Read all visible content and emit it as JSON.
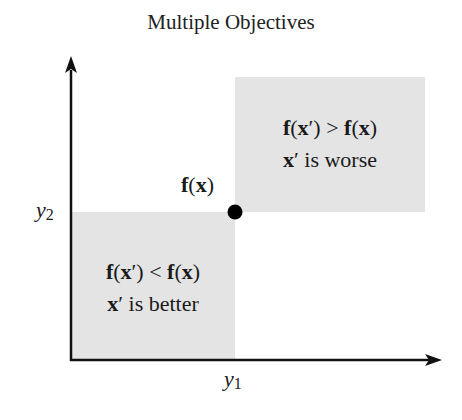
{
  "title": "Multiple Objectives",
  "axes": {
    "x_label_var": "y",
    "x_label_sub": "1",
    "y_label_var": "y",
    "y_label_sub": "2"
  },
  "point": {
    "label_f": "f",
    "label_open": "(",
    "label_x": "x",
    "label_close": ")"
  },
  "regions": {
    "worse": {
      "line1_f1": "f",
      "line1_x1": "x",
      "line1_prime": "′",
      "line1_op": ">",
      "line1_f2": "f",
      "line1_x2": "x",
      "line2_x": "x",
      "line2_prime": "′",
      "line2_text": " is worse"
    },
    "better": {
      "line1_f1": "f",
      "line1_x1": "x",
      "line1_prime": "′",
      "line1_op": "<",
      "line1_f2": "f",
      "line1_x2": "x",
      "line2_x": "x",
      "line2_prime": "′",
      "line2_text": " is better"
    }
  },
  "colors": {
    "region_fill": "#e4e4e4",
    "axis": "#111111",
    "point": "#000000"
  }
}
